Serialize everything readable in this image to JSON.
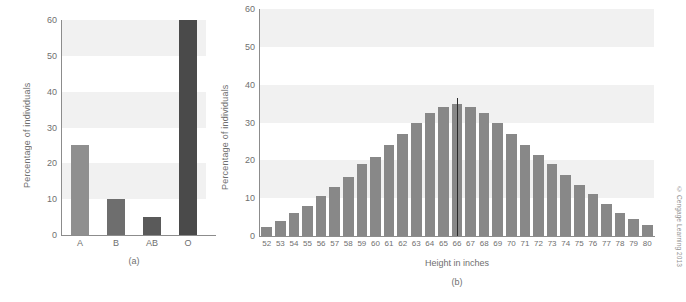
{
  "figure": {
    "copyright": "© Cengage Learning 2013"
  },
  "chart_data": [
    {
      "id": "panel-a",
      "type": "bar",
      "title": "",
      "caption": "(a)",
      "xlabel": "",
      "ylabel": "Percentage of individuals",
      "categories": [
        "A",
        "B",
        "AB",
        "O"
      ],
      "values": [
        25,
        10,
        5,
        60
      ],
      "bar_colors": [
        "#8f8f8f",
        "#6e6e6e",
        "#5a5a5a",
        "#4a4a4a"
      ],
      "ylim": [
        0,
        60
      ],
      "yticks": [
        0,
        10,
        20,
        30,
        40,
        50,
        60
      ],
      "ytick_labels": [
        "0",
        "10",
        "20",
        "30",
        "40",
        "50",
        "60"
      ],
      "grid": false,
      "bands": [
        [
          10,
          20
        ],
        [
          30,
          40
        ],
        [
          50,
          60
        ]
      ],
      "band_color": "#f1f1f1",
      "legend": "none"
    },
    {
      "id": "panel-b",
      "type": "bar",
      "title": "",
      "caption": "(b)",
      "xlabel": "Height in inches",
      "ylabel": "Percentage of individuals",
      "categories": [
        "52",
        "53",
        "54",
        "55",
        "56",
        "57",
        "58",
        "59",
        "60",
        "61",
        "62",
        "63",
        "64",
        "65",
        "66",
        "67",
        "68",
        "69",
        "70",
        "71",
        "72",
        "73",
        "74",
        "75",
        "76",
        "77",
        "78",
        "79",
        "80"
      ],
      "values": [
        2.5,
        4,
        6,
        8,
        10.5,
        13,
        15.5,
        19,
        21,
        24,
        27,
        30,
        32.5,
        34,
        35,
        34,
        32.5,
        30,
        27,
        24,
        21.5,
        19,
        16,
        13.5,
        11,
        8.5,
        6,
        4.5,
        3
      ],
      "bar_color": "#888888",
      "ylim": [
        0,
        60
      ],
      "yticks": [
        0,
        10,
        20,
        30,
        40,
        50,
        60
      ],
      "ytick_labels": [
        "0",
        "10",
        "20",
        "30",
        "40",
        "50",
        "60"
      ],
      "grid": false,
      "bands": [
        [
          10,
          20
        ],
        [
          30,
          40
        ],
        [
          50,
          60
        ]
      ],
      "band_color": "#f1f1f1",
      "annotations": [
        {
          "type": "vertical-line",
          "at_category": "66",
          "label": "",
          "color": "#2b2b2b"
        }
      ],
      "legend": "none"
    }
  ]
}
